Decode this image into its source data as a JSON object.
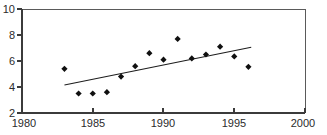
{
  "figure": {
    "clipped_header_text": "",
    "background_color": "#ffffff",
    "marker_color": "#101010",
    "line_color": "#1d1d1d",
    "axis_color": "#3b3b3b"
  },
  "chart_data": {
    "type": "scatter",
    "title": "",
    "subtitle": "",
    "xlabel": "",
    "ylabel": "",
    "xlim": [
      1980,
      2000
    ],
    "ylim": [
      2,
      10
    ],
    "xticks": [
      1980,
      1985,
      1990,
      1995,
      2000
    ],
    "yticks": [
      2,
      4,
      6,
      8,
      10
    ],
    "xticklabels": [
      "1980",
      "1985",
      "1990",
      "1995",
      "2000"
    ],
    "yticklabels": [
      "2",
      "4",
      "6",
      "8",
      "10"
    ],
    "grid": false,
    "legend": null,
    "legend_position": "none",
    "series": [
      {
        "name": "observations",
        "type": "scatter",
        "marker": "diamond",
        "x": [
          1983,
          1984,
          1985,
          1986,
          1987,
          1988,
          1989,
          1990,
          1991,
          1992,
          1993,
          1994,
          1995,
          1996
        ],
        "y": [
          5.4,
          3.5,
          3.5,
          3.6,
          4.8,
          5.6,
          6.6,
          6.1,
          7.7,
          6.2,
          6.5,
          7.1,
          6.35,
          5.55
        ]
      },
      {
        "name": "trend",
        "type": "line",
        "x": [
          1983.0,
          1996.2
        ],
        "y": [
          4.15,
          7.05
        ]
      }
    ]
  }
}
